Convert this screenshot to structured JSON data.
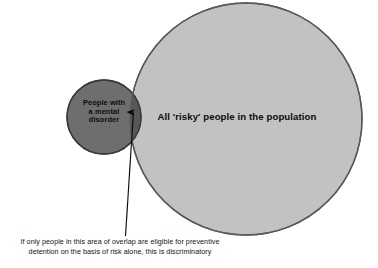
{
  "diagram": {
    "type": "venn-diagram",
    "title_text": "",
    "background_color": "#ffffff",
    "circles": {
      "mental_disorder": {
        "label": "People with\na mental\ndisorder",
        "fill_color": "#6e6e6e",
        "stroke_color": "#3a3a3a",
        "center_x": 104,
        "center_y": 117,
        "radius": 37
      },
      "risky_population": {
        "label": "All 'risky' people in the population",
        "fill_color": "#c2c2c2",
        "stroke_color": "#5a5a5a",
        "center_x": 246,
        "center_y": 119,
        "radius": 116
      }
    },
    "overlap": {
      "name": "area-of-overlap",
      "fill_color": "#575757"
    },
    "annotation": {
      "arrow_color": "#0a0a0a",
      "caption_lines": [
        "If only people in this area of overlap are eligible for preventive",
        "detention on the basis of risk alone, this is discriminatory"
      ]
    }
  }
}
